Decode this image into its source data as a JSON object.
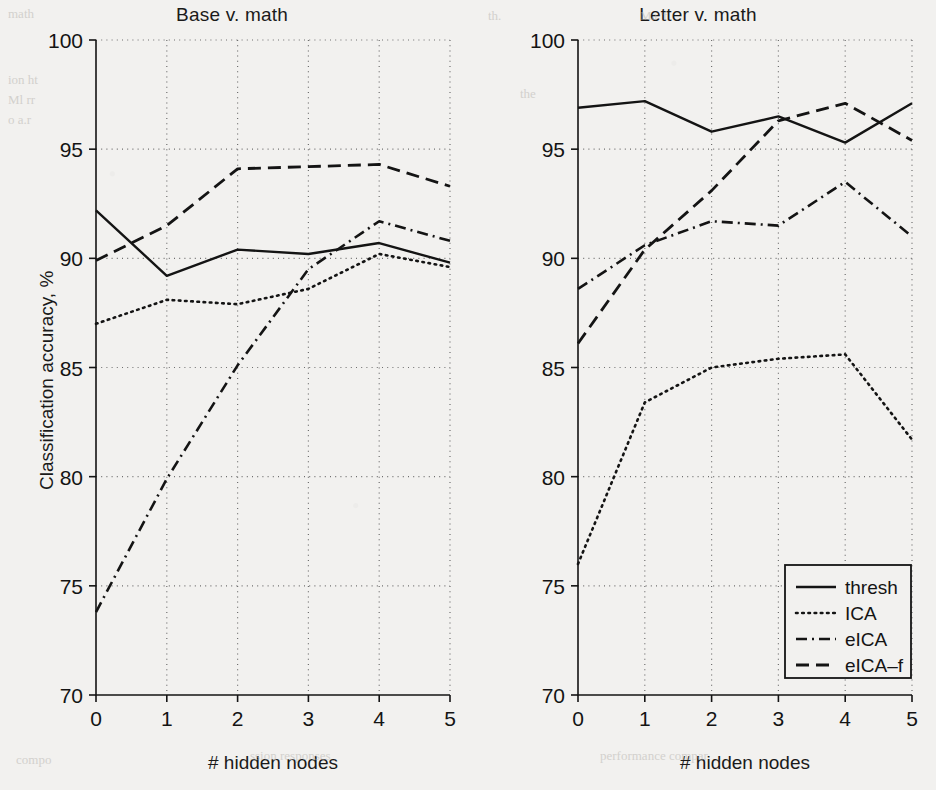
{
  "figure": {
    "background_color": "#f2f1ef",
    "ink_color": "#141414",
    "grid_color": "#6e6e6e"
  },
  "axis_labels": {
    "y_axis_label": "Classification accuracy, %",
    "x_axis_label_left": "# hidden nodes",
    "x_axis_label_right": "# hidden nodes"
  },
  "legend": {
    "position": "lower-right of right panel",
    "entries": [
      {
        "label": "thresh",
        "style": "solid"
      },
      {
        "label": "ICA",
        "style": "dotted"
      },
      {
        "label": "eICA",
        "style": "dash-dot"
      },
      {
        "label": "eICA-f",
        "style": "dashed"
      }
    ]
  },
  "ticks": {
    "y": [
      "70",
      "75",
      "80",
      "85",
      "90",
      "95",
      "100"
    ],
    "x": [
      "0",
      "1",
      "2",
      "3",
      "4",
      "5"
    ]
  },
  "chart_data": [
    {
      "type": "line",
      "title": "Base v. math",
      "xlabel": "# hidden nodes",
      "ylabel": "Classification accuracy, %",
      "x": [
        0,
        1,
        2,
        3,
        4,
        5
      ],
      "xlim": [
        0,
        5
      ],
      "ylim": [
        70,
        100
      ],
      "ytick_step": 5,
      "grid": true,
      "legend": [
        "thresh",
        "ICA",
        "eICA",
        "eICA-f"
      ],
      "series": [
        {
          "name": "thresh",
          "style": "solid",
          "values": [
            92.2,
            89.2,
            90.4,
            90.2,
            90.7,
            89.8
          ]
        },
        {
          "name": "ICA",
          "style": "dotted",
          "values": [
            87.0,
            88.1,
            87.9,
            88.6,
            90.2,
            89.6
          ]
        },
        {
          "name": "eICA",
          "style": "dash-dot",
          "values": [
            73.8,
            79.9,
            85.1,
            89.5,
            91.7,
            90.8
          ]
        },
        {
          "name": "eICA-f",
          "style": "dashed",
          "values": [
            89.9,
            91.5,
            94.1,
            94.2,
            94.3,
            93.3
          ]
        }
      ]
    },
    {
      "type": "line",
      "title": "Letter v. math",
      "xlabel": "# hidden nodes",
      "ylabel": "Classification accuracy, %",
      "x": [
        0,
        1,
        2,
        3,
        4,
        5
      ],
      "xlim": [
        0,
        5
      ],
      "ylim": [
        70,
        100
      ],
      "ytick_step": 5,
      "grid": true,
      "legend": [
        "thresh",
        "ICA",
        "eICA",
        "eICA-f"
      ],
      "series": [
        {
          "name": "thresh",
          "style": "solid",
          "values": [
            96.9,
            97.2,
            95.8,
            96.5,
            95.3,
            97.1
          ]
        },
        {
          "name": "ICA",
          "style": "dotted",
          "values": [
            76.0,
            83.4,
            85.0,
            85.4,
            85.6,
            81.7
          ]
        },
        {
          "name": "eICA",
          "style": "dash-dot",
          "values": [
            88.6,
            90.6,
            91.7,
            91.5,
            93.5,
            91.0
          ]
        },
        {
          "name": "eICA-f",
          "style": "dashed",
          "values": [
            86.1,
            90.4,
            93.1,
            96.3,
            97.1,
            95.4
          ]
        }
      ]
    }
  ],
  "panels": [
    {
      "title": "Base v. math"
    },
    {
      "title": "Letter v. math"
    }
  ]
}
